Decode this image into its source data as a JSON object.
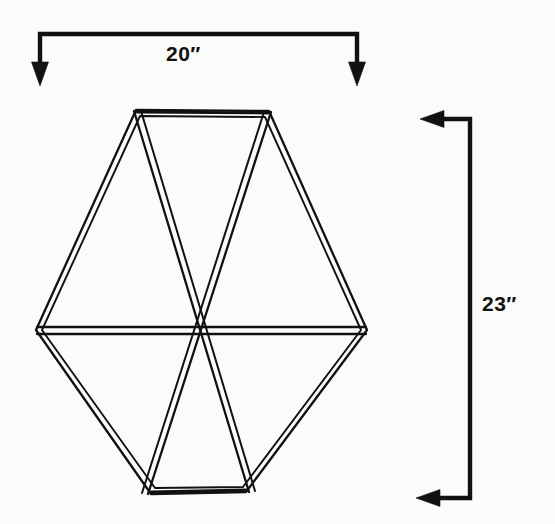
{
  "figure": {
    "background_color": "#fbfbf9",
    "ink_color": "#111111"
  },
  "dimensions": {
    "width": {
      "label": "20″",
      "value": 20,
      "unit": "inches",
      "orientation": "horizontal",
      "position": "top",
      "arrow_direction": "down-both-ends"
    },
    "height": {
      "label": "23″",
      "value": 23,
      "unit": "inches",
      "orientation": "vertical",
      "position": "right",
      "arrow_direction": "left-both-ends"
    }
  },
  "shape": {
    "name": "hexagon",
    "sides": 6,
    "interior_divisions": 3,
    "triangle_count": 6,
    "stroke_style": "double-line-slat",
    "vertices": [
      {
        "name": "top-left",
        "x": 137,
        "y": 112
      },
      {
        "name": "top-right",
        "x": 268,
        "y": 113
      },
      {
        "name": "right",
        "x": 365,
        "y": 330
      },
      {
        "name": "bottom-right",
        "x": 245,
        "y": 490
      },
      {
        "name": "bottom-left",
        "x": 152,
        "y": 492
      },
      {
        "name": "left",
        "x": 38,
        "y": 330
      }
    ],
    "center": {
      "x": 202,
      "y": 330
    },
    "diameters": [
      {
        "name": "horizontal-diameter",
        "from": "left",
        "to": "right"
      },
      {
        "name": "diagonal-top-left-to-bottom-right",
        "from": "top-left",
        "to": "bottom-right"
      },
      {
        "name": "diagonal-top-right-to-bottom-left",
        "from": "top-right",
        "to": "bottom-left"
      }
    ]
  }
}
